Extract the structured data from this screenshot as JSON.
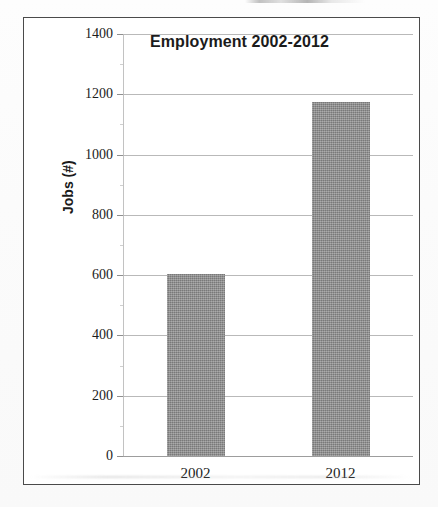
{
  "chart_data": {
    "type": "bar",
    "title": "Employment 2002-2012",
    "xlabel": "",
    "ylabel": "Jobs (#)",
    "categories": [
      "2002",
      "2012"
    ],
    "values": [
      605,
      1175
    ],
    "ylim": [
      0,
      1400
    ],
    "ytick_step": 200,
    "yticks": [
      "0",
      "200",
      "400",
      "600",
      "800",
      "1000",
      "1200",
      "1400"
    ],
    "ytick_values": [
      0,
      200,
      400,
      600,
      800,
      1000,
      1200,
      1400
    ],
    "grid": true,
    "legend": false,
    "legend_position": "none",
    "bar_color": "#8a8a8a",
    "gridline_color": "#b9b9b9",
    "border_color": "#4a4a4a",
    "text_color": "#1c1c1c"
  }
}
